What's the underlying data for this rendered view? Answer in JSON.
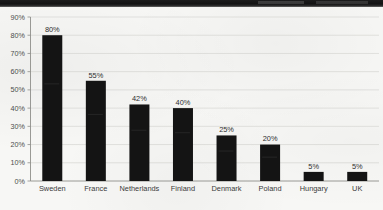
{
  "chart_data": {
    "type": "bar",
    "title": "",
    "subtitle": "",
    "xlabel": "",
    "ylabel": "",
    "categories": [
      "Sweden",
      "France",
      "Netherlands",
      "Finland",
      "Denmark",
      "Poland",
      "Hungary",
      "UK"
    ],
    "values": [
      80,
      55,
      42,
      40,
      25,
      20,
      5,
      5
    ],
    "value_labels": [
      "80%",
      "55%",
      "42%",
      "40%",
      "25%",
      "20%",
      "5%",
      "5%"
    ],
    "ylim": [
      0,
      90
    ],
    "ytick_labels": [
      "90%",
      "80%",
      "70%",
      "60%",
      "50%",
      "40%",
      "30%",
      "20%",
      "10%",
      "0%"
    ],
    "ytick_values": [
      90,
      80,
      70,
      60,
      50,
      40,
      30,
      20,
      10,
      0
    ],
    "grid": true,
    "legend": "none",
    "bar_color": "#141414",
    "axis_color": "#8e8e8a",
    "grid_color": "#c9c9c4",
    "background_color": "#f7f7f5",
    "text_color": "#3a3a3a"
  }
}
